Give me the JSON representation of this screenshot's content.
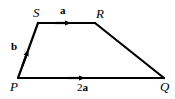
{
  "figure": {
    "type": "vector-diagram",
    "shape": "trapezium",
    "width": 175,
    "height": 99,
    "background_color": "#ffffff",
    "stroke_color": "#000000",
    "stroke_width": 2.2,
    "vertices": [
      {
        "name": "P",
        "label": "P",
        "x": 18,
        "y": 78,
        "label_x": 10,
        "label_y": 80
      },
      {
        "name": "S",
        "label": "S",
        "x": 38,
        "y": 23,
        "label_x": 33,
        "label_y": 6
      },
      {
        "name": "R",
        "label": "R",
        "x": 95,
        "y": 23,
        "label_x": 96,
        "label_y": 7
      },
      {
        "name": "Q",
        "label": "Q",
        "x": 164,
        "y": 78,
        "label_x": 160,
        "label_y": 80
      }
    ],
    "edges": [
      {
        "name": "edge-PS",
        "from": "P",
        "to": "S",
        "arrow": true,
        "arrow_position": 0.55
      },
      {
        "name": "edge-SR",
        "from": "S",
        "to": "R",
        "arrow": true,
        "arrow_position": 0.58
      },
      {
        "name": "edge-RQ",
        "from": "R",
        "to": "Q",
        "arrow": false
      },
      {
        "name": "edge-PQ",
        "from": "P",
        "to": "Q",
        "arrow": true,
        "arrow_position": 0.46
      }
    ],
    "vector_labels": [
      {
        "name": "vector-label-a",
        "coefficient": "",
        "vector": "a",
        "text": "a",
        "edge": "edge-SR",
        "x": 60,
        "y": 5
      },
      {
        "name": "vector-label-b",
        "coefficient": "",
        "vector": "b",
        "text": "b",
        "edge": "edge-PS",
        "x": 11,
        "y": 41
      },
      {
        "name": "vector-label-2a",
        "coefficient": "2",
        "vector": "a",
        "text": "2a",
        "edge": "edge-PQ",
        "x": 77,
        "y": 82
      }
    ]
  }
}
